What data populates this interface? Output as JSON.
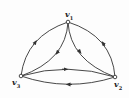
{
  "diagram": {
    "type": "directed-graph",
    "nodes": [
      {
        "id": "v1",
        "label": "v",
        "sub": "1",
        "x": 68,
        "y": 22
      },
      {
        "id": "v2",
        "label": "v",
        "sub": "2",
        "x": 115,
        "y": 77
      },
      {
        "id": "v3",
        "label": "v",
        "sub": "3",
        "x": 21,
        "y": 76
      }
    ],
    "edges": [
      {
        "from": "v3",
        "to": "v1",
        "kind": "outer-left-arc"
      },
      {
        "from": "v1",
        "to": "v3",
        "kind": "inner-left-arc"
      },
      {
        "from": "v1",
        "to": "v2",
        "kind": "inner-right-arc"
      },
      {
        "from": "v2",
        "to": "v1",
        "kind": "outer-right-arc"
      },
      {
        "from": "v3",
        "to": "v2",
        "kind": "upper-bottom-arc"
      },
      {
        "from": "v2",
        "to": "v3",
        "kind": "lower-bottom-arc"
      }
    ],
    "colors": {
      "stroke": "#333333",
      "node_fill": "#ffffff",
      "background": "#fdfdfd"
    }
  }
}
